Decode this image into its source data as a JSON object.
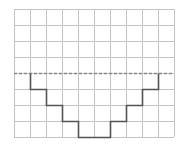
{
  "diagram": {
    "type": "grid-step-figure",
    "grid": {
      "columns": 10,
      "rows": 8,
      "origin_x": 14,
      "origin_y": 9,
      "cell_size": 16,
      "line_color": "#c4c4c4"
    },
    "dashed_line": {
      "row": 4,
      "color": "#8a8a8a"
    },
    "step_path": {
      "color": "#555555",
      "points_grid": [
        [
          1,
          4
        ],
        [
          1,
          5
        ],
        [
          2,
          5
        ],
        [
          2,
          6
        ],
        [
          3,
          6
        ],
        [
          3,
          7
        ],
        [
          4,
          7
        ],
        [
          4,
          8
        ],
        [
          6,
          8
        ],
        [
          6,
          7
        ],
        [
          7,
          7
        ],
        [
          7,
          6
        ],
        [
          8,
          6
        ],
        [
          8,
          5
        ],
        [
          9,
          5
        ],
        [
          9,
          4
        ]
      ]
    }
  }
}
